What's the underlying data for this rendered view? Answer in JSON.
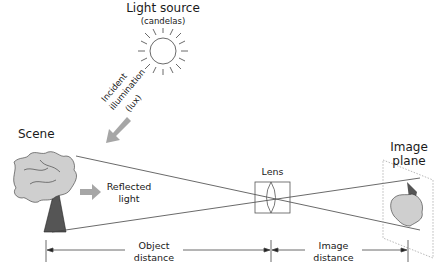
{
  "diagram": {
    "type": "optics-imaging-geometry",
    "light_source": {
      "title": "Light source",
      "unit": "(candelas)"
    },
    "incident": {
      "line1": "Incident",
      "line2": "illumination",
      "line3": "(lux)"
    },
    "scene": {
      "label": "Scene"
    },
    "reflected": {
      "line1": "Reflected",
      "line2": "light"
    },
    "lens": {
      "label": "Lens"
    },
    "image_plane": {
      "line1": "Image",
      "line2": "plane"
    },
    "object_distance": {
      "line1": "Object",
      "line2": "distance"
    },
    "image_distance": {
      "line1": "Image",
      "line2": "distance"
    },
    "colors": {
      "line": "#333333",
      "arrow_fill": "#a6a6a6",
      "tree_foliage": "#cfcfcf",
      "tree_trunk": "#555555"
    }
  }
}
